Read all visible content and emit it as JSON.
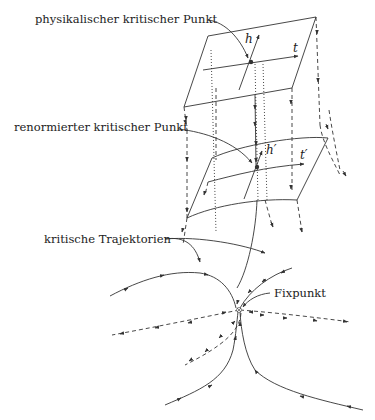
{
  "diagram": {
    "labels": {
      "physical_critical_point": "physikalischer kritischer Punkt",
      "renormalized_critical_point": "renormierter kritischer Punkt",
      "critical_trajectories": "kritische Trajektorien",
      "fixed_point": "Fixpunkt"
    },
    "axes": {
      "top_plane": {
        "h": "h",
        "t": "t"
      },
      "middle_plane": {
        "h": "h′",
        "t": "t′"
      }
    },
    "colors": {
      "stroke": "#333333",
      "background": "#ffffff"
    }
  }
}
